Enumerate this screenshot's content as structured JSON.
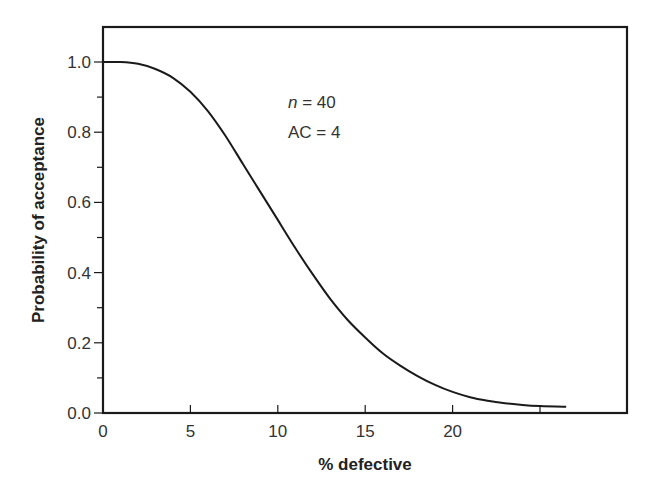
{
  "chart_data": {
    "type": "line",
    "title": "",
    "xlabel": "% defective",
    "ylabel": "Probability of acceptance",
    "xlim": [
      0,
      30
    ],
    "ylim": [
      0,
      1.1
    ],
    "x_ticks": [
      0,
      5,
      10,
      15,
      20,
      25
    ],
    "x_tick_labels": [
      "0",
      "5",
      "10",
      "15",
      "20",
      ""
    ],
    "y_ticks": [
      0.0,
      0.1,
      0.2,
      0.3,
      0.4,
      0.5,
      0.6,
      0.7,
      0.8,
      0.9,
      1.0
    ],
    "y_tick_labels": [
      "0.0",
      "",
      "0.2",
      "",
      "0.4",
      "",
      "0.6",
      "",
      "0.8",
      "",
      "1.0"
    ],
    "grid": false,
    "legend": null,
    "annotations": [
      {
        "text_italic": "n",
        "text": " = 40",
        "x": 10.5,
        "y": 0.86
      },
      {
        "text": "AC = 4",
        "x": 10.5,
        "y": 0.78
      }
    ],
    "series": [
      {
        "name": "OC curve (n = 40, AC = 4)",
        "x": [
          0,
          1,
          2,
          3,
          4,
          5,
          6,
          7,
          8,
          9,
          10,
          11,
          12,
          13,
          14,
          15,
          16,
          17,
          18,
          19,
          20,
          21,
          22,
          23,
          24,
          25,
          26.5
        ],
        "y": [
          1.0,
          1.0,
          0.995,
          0.98,
          0.955,
          0.915,
          0.86,
          0.79,
          0.71,
          0.63,
          0.55,
          0.47,
          0.395,
          0.325,
          0.265,
          0.215,
          0.17,
          0.135,
          0.105,
          0.08,
          0.06,
          0.045,
          0.035,
          0.028,
          0.023,
          0.02,
          0.018
        ]
      }
    ]
  }
}
